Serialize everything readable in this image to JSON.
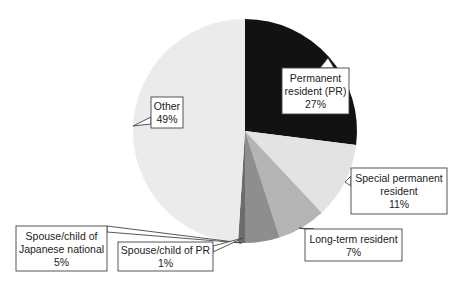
{
  "chart_data": {
    "type": "pie",
    "title": "",
    "start_angle_deg": 0,
    "direction": "clockwise",
    "center": [
      245,
      131
    ],
    "radius": 112,
    "slices": [
      {
        "label_lines": [
          "Permanent",
          "resident (PR)",
          "27%"
        ],
        "name": "Permanent resident (PR)",
        "value": 27,
        "color": "#121212",
        "box": {
          "x": 282,
          "y": 68,
          "w": 67,
          "h": 46
        },
        "pointer": {
          "tip": [
            328,
            58
          ],
          "base": [
            [
              320,
              68
            ],
            [
              334,
              68
            ]
          ]
        }
      },
      {
        "label_lines": [
          "Special permanent",
          "resident",
          "11%"
        ],
        "name": "Special permanent resident",
        "value": 11,
        "color": "#e3e3e3",
        "box": {
          "x": 351,
          "y": 168,
          "w": 96,
          "h": 46
        },
        "pointer": {
          "tip": [
            345,
            182
          ],
          "base": [
            [
              351,
              176
            ],
            [
              351,
              186
            ]
          ]
        }
      },
      {
        "label_lines": [
          "Long-term resident",
          "7%"
        ],
        "name": "Long-term resident",
        "value": 7,
        "color": "#b4b4b4",
        "box": {
          "x": 305,
          "y": 229,
          "w": 97,
          "h": 32
        },
        "pointer": {
          "tip": [
            299,
            228
          ],
          "base": [
            [
              305,
              229
            ],
            [
              314,
              229
            ]
          ]
        }
      },
      {
        "label_lines": [
          "Spouse/child of",
          "Japanese national",
          "5%"
        ],
        "name": "Spouse/child of Japanese national",
        "value": 5,
        "color": "#8e8e8e",
        "box": {
          "x": 16,
          "y": 226,
          "w": 91,
          "h": 45
        },
        "pointer": {
          "tip": [
            242,
            243
          ],
          "base": [
            [
              107,
              226
            ],
            [
              107,
              232
            ]
          ]
        }
      },
      {
        "label_lines": [
          "Spouse/child of PR",
          "1%"
        ],
        "name": "Spouse/child of PR",
        "value": 1,
        "color": "#6c6c6c",
        "box": {
          "x": 118,
          "y": 242,
          "w": 95,
          "h": 29
        },
        "pointer": {
          "tip": [
            243,
            238
          ],
          "base": [
            [
              213,
              246
            ],
            [
              213,
              252
            ]
          ]
        }
      },
      {
        "label_lines": [
          "Other",
          "49%"
        ],
        "name": "Other",
        "value": 49,
        "color": "#ebebeb",
        "box": {
          "x": 151,
          "y": 97,
          "w": 32,
          "h": 31
        },
        "pointer": {
          "tip": [
            133,
            126
          ],
          "base": [
            [
              151,
              117
            ],
            [
              151,
              124
            ]
          ]
        }
      }
    ]
  }
}
